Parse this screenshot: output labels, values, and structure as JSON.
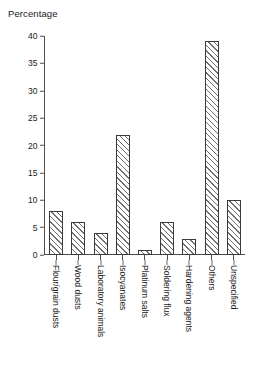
{
  "chart_data": {
    "type": "bar",
    "title": "",
    "xlabel": "",
    "ylabel": "Percentage",
    "ylim": [
      0,
      40
    ],
    "yticks": [
      0,
      5,
      10,
      15,
      20,
      25,
      30,
      35,
      40
    ],
    "grid": false,
    "legend": "none",
    "bar_style": "diagonal-hatch",
    "categories": [
      "Flour/grain dusts",
      "Wood dusts",
      "Laboratory animals",
      "Isocyanates",
      "Platinum salts",
      "Soldering flux",
      "Hardening agents",
      "Others",
      "Unspecified"
    ],
    "values": [
      8,
      6,
      4,
      22,
      1,
      6,
      3,
      39,
      10
    ]
  },
  "colors": {
    "axis": "#4d4d4d",
    "bar_outline": "#3a3a3a",
    "hatch": "#707070",
    "text": "#1a1a1a",
    "background": "#ffffff"
  }
}
